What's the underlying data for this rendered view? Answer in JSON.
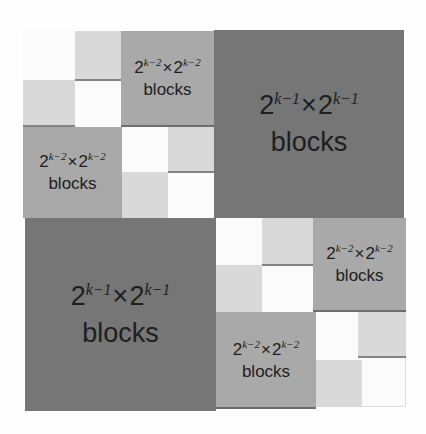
{
  "diagram": {
    "colors": {
      "white": "#fbfbfb",
      "light": "#d9d9d9",
      "medium": "#a9a9a9",
      "dark": "#767676",
      "text": "#1e1e1e"
    },
    "large_blocks": [
      {
        "position": "top-right",
        "base": "2",
        "exp": "k−1",
        "times": "×",
        "base2": "2",
        "exp2": "k−1",
        "word": "blocks"
      },
      {
        "position": "bottom-left",
        "base": "2",
        "exp": "k−1",
        "times": "×",
        "base2": "2",
        "exp2": "k−1",
        "word": "blocks"
      }
    ],
    "medium_blocks": [
      {
        "position": "top-left-quadrant top-right",
        "base": "2",
        "exp": "k−2",
        "times": "×",
        "base2": "2",
        "exp2": "k−2",
        "word": "blocks"
      },
      {
        "position": "top-left-quadrant bottom-left",
        "base": "2",
        "exp": "k−2",
        "times": "×",
        "base2": "2",
        "exp2": "k−2",
        "word": "blocks"
      },
      {
        "position": "bottom-right-quadrant top-right",
        "base": "2",
        "exp": "k−2",
        "times": "×",
        "base2": "2",
        "exp2": "k−2",
        "word": "blocks"
      },
      {
        "position": "bottom-right-quadrant bottom-left",
        "base": "2",
        "exp": "k−2",
        "times": "×",
        "base2": "2",
        "exp2": "k−2",
        "word": "blocks"
      }
    ]
  }
}
